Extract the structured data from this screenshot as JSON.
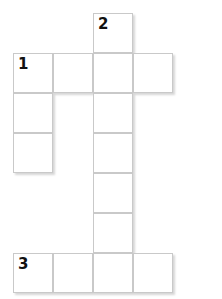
{
  "puzzle": {
    "kind": "crossword-grid",
    "title": "",
    "columns": 5,
    "rows": 7,
    "cell_size": 40,
    "origin_x": 13,
    "origin_y": 13,
    "colors": {
      "cell_fill": "#ffffff",
      "cell_border": "#c9c9c9",
      "number_text": "#111111",
      "page_background": "#ffffff"
    },
    "cells": [
      {
        "row": 0,
        "col": 2,
        "number": "2",
        "letter": ""
      },
      {
        "row": 1,
        "col": 0,
        "number": "1",
        "letter": ""
      },
      {
        "row": 1,
        "col": 1,
        "number": "",
        "letter": ""
      },
      {
        "row": 1,
        "col": 2,
        "number": "",
        "letter": ""
      },
      {
        "row": 1,
        "col": 3,
        "number": "",
        "letter": ""
      },
      {
        "row": 2,
        "col": 0,
        "number": "",
        "letter": ""
      },
      {
        "row": 2,
        "col": 2,
        "number": "",
        "letter": ""
      },
      {
        "row": 3,
        "col": 0,
        "number": "",
        "letter": ""
      },
      {
        "row": 3,
        "col": 2,
        "number": "",
        "letter": ""
      },
      {
        "row": 4,
        "col": 2,
        "number": "",
        "letter": ""
      },
      {
        "row": 5,
        "col": 2,
        "number": "",
        "letter": ""
      },
      {
        "row": 6,
        "col": 0,
        "number": "3",
        "letter": ""
      },
      {
        "row": 6,
        "col": 1,
        "number": "",
        "letter": ""
      },
      {
        "row": 6,
        "col": 2,
        "number": "",
        "letter": ""
      },
      {
        "row": 6,
        "col": 3,
        "number": "",
        "letter": ""
      }
    ]
  }
}
